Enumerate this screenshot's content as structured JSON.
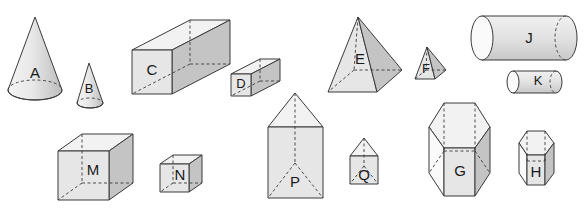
{
  "figure": {
    "shapes": [
      {
        "id": "A",
        "label": "A",
        "type": "cone",
        "size": "large"
      },
      {
        "id": "B",
        "label": "B",
        "type": "cone",
        "size": "small"
      },
      {
        "id": "C",
        "label": "C",
        "type": "square prism",
        "size": "large"
      },
      {
        "id": "D",
        "label": "D",
        "type": "square prism",
        "size": "small"
      },
      {
        "id": "E",
        "label": "E",
        "type": "square pyramid",
        "size": "large"
      },
      {
        "id": "F",
        "label": "F",
        "type": "square pyramid",
        "size": "small"
      },
      {
        "id": "J",
        "label": "J",
        "type": "cylinder",
        "size": "large"
      },
      {
        "id": "K",
        "label": "K",
        "type": "cylinder",
        "size": "small"
      },
      {
        "id": "M",
        "label": "M",
        "type": "cube",
        "size": "large"
      },
      {
        "id": "N",
        "label": "N",
        "type": "cube",
        "size": "small"
      },
      {
        "id": "P",
        "label": "P",
        "type": "triangular prism",
        "size": "large"
      },
      {
        "id": "Q",
        "label": "Q",
        "type": "triangular prism",
        "size": "small"
      },
      {
        "id": "G",
        "label": "G",
        "type": "hexagonal prism",
        "size": "large"
      },
      {
        "id": "H",
        "label": "H",
        "type": "hexagonal prism",
        "size": "small"
      }
    ]
  },
  "colors": {
    "edge": "#3a3a3a",
    "face_front": "#e6e6e6",
    "face_dark": "#c4c4c4",
    "face_light": "#f2f2f2",
    "background": "#ffffff"
  }
}
